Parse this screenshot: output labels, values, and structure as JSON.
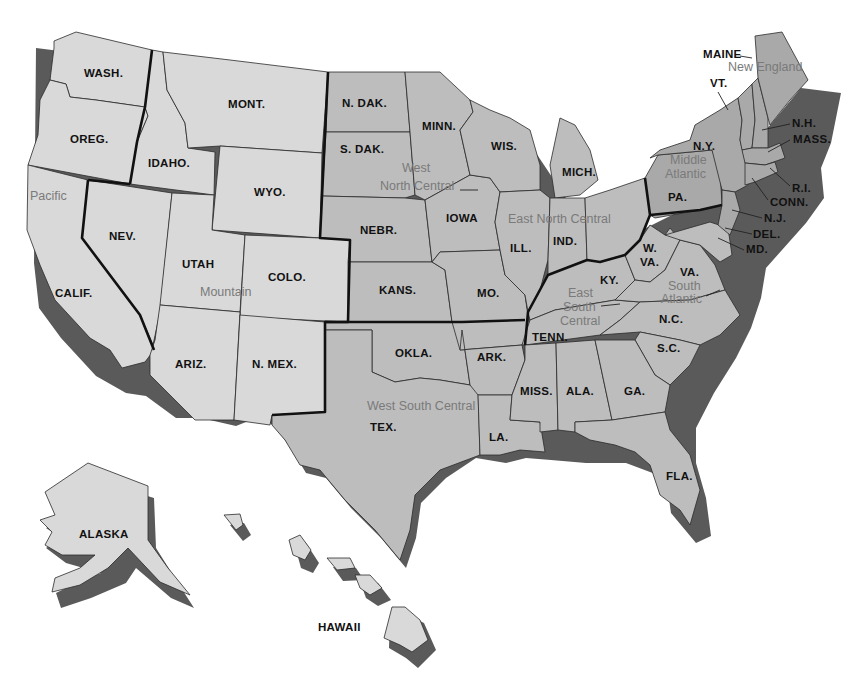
{
  "map": {
    "title": "United States Census Regions",
    "colors": {
      "mountain_pacific": "#d9d9d9",
      "central": "#bdbdbd",
      "northeast": "#a9a9a9",
      "shadow": "#5a5a5a",
      "region_label": "#7a7a7a",
      "state_label": "#111111"
    },
    "regions": [
      {
        "name": "Pacific",
        "x": 30,
        "y": 200
      },
      {
        "name": "Mountain",
        "x": 200,
        "y": 296
      },
      {
        "name": "West",
        "x": 402,
        "y": 172
      },
      {
        "name": "North Central",
        "x": 380,
        "y": 190
      },
      {
        "name": "East North Central",
        "x": 508,
        "y": 223
      },
      {
        "name": "New England",
        "x": 728,
        "y": 71
      },
      {
        "name": "Middle",
        "x": 670,
        "y": 164
      },
      {
        "name": "Atlantic",
        "x": 665,
        "y": 178
      },
      {
        "name": "East",
        "x": 568,
        "y": 297
      },
      {
        "name": "South",
        "x": 563,
        "y": 311
      },
      {
        "name": "Central",
        "x": 560,
        "y": 325
      },
      {
        "name": "South",
        "x": 668,
        "y": 290
      },
      {
        "name": "Atlantic",
        "x": 661,
        "y": 303
      },
      {
        "name": "West South Central",
        "x": 367,
        "y": 410
      }
    ],
    "states": [
      {
        "label": "WASH.",
        "x": 84,
        "y": 77
      },
      {
        "label": "OREG.",
        "x": 70,
        "y": 143
      },
      {
        "label": "IDAHO.",
        "x": 148,
        "y": 167
      },
      {
        "label": "MONT.",
        "x": 228,
        "y": 108
      },
      {
        "label": "WYO.",
        "x": 254,
        "y": 196
      },
      {
        "label": "NEV.",
        "x": 109,
        "y": 240
      },
      {
        "label": "UTAH",
        "x": 182,
        "y": 268
      },
      {
        "label": "COLO.",
        "x": 268,
        "y": 281
      },
      {
        "label": "CALIF.",
        "x": 55,
        "y": 297
      },
      {
        "label": "ARIZ.",
        "x": 175,
        "y": 368
      },
      {
        "label": "N. MEX.",
        "x": 252,
        "y": 368
      },
      {
        "label": "N. DAK.",
        "x": 342,
        "y": 107
      },
      {
        "label": "S. DAK.",
        "x": 340,
        "y": 153
      },
      {
        "label": "NEBR.",
        "x": 360,
        "y": 234
      },
      {
        "label": "KANS.",
        "x": 379,
        "y": 294
      },
      {
        "label": "OKLA.",
        "x": 395,
        "y": 357
      },
      {
        "label": "TEX.",
        "x": 370,
        "y": 431
      },
      {
        "label": "MINN.",
        "x": 422,
        "y": 130
      },
      {
        "label": "IOWA",
        "x": 446,
        "y": 222
      },
      {
        "label": "MO.",
        "x": 477,
        "y": 297
      },
      {
        "label": "ARK.",
        "x": 477,
        "y": 361
      },
      {
        "label": "LA.",
        "x": 489,
        "y": 441
      },
      {
        "label": "WIS.",
        "x": 491,
        "y": 150
      },
      {
        "label": "MICH.",
        "x": 562,
        "y": 176
      },
      {
        "label": "ILL.",
        "x": 510,
        "y": 252
      },
      {
        "label": "IND.",
        "x": 553,
        "y": 245
      },
      {
        "label": "KY.",
        "x": 600,
        "y": 284
      },
      {
        "label": "TENN.",
        "x": 532,
        "y": 341
      },
      {
        "label": "MISS.",
        "x": 520,
        "y": 395
      },
      {
        "label": "ALA.",
        "x": 566,
        "y": 395
      },
      {
        "label": "GA.",
        "x": 624,
        "y": 395
      },
      {
        "label": "FLA.",
        "x": 666,
        "y": 480
      },
      {
        "label": "W.",
        "x": 643,
        "y": 252
      },
      {
        "label": "VA.",
        "x": 640,
        "y": 266
      },
      {
        "label": "VA.",
        "x": 680,
        "y": 276
      },
      {
        "label": "N.C.",
        "x": 659,
        "y": 323
      },
      {
        "label": "S.C.",
        "x": 657,
        "y": 352
      },
      {
        "label": "PA.",
        "x": 668,
        "y": 201
      },
      {
        "label": "N.Y.",
        "x": 693,
        "y": 150
      },
      {
        "label": "VT.",
        "x": 710,
        "y": 87
      },
      {
        "label": "MAINE",
        "x": 703,
        "y": 58
      },
      {
        "label": "N.H.",
        "x": 792,
        "y": 127
      },
      {
        "label": "MASS.",
        "x": 793,
        "y": 143
      },
      {
        "label": "R.I.",
        "x": 792,
        "y": 192
      },
      {
        "label": "CONN.",
        "x": 770,
        "y": 206
      },
      {
        "label": "N.J.",
        "x": 764,
        "y": 222
      },
      {
        "label": "DEL.",
        "x": 753,
        "y": 238
      },
      {
        "label": "MD.",
        "x": 746,
        "y": 253
      },
      {
        "label": "ALASKA",
        "x": 79,
        "y": 538
      },
      {
        "label": "HAWAII",
        "x": 318,
        "y": 631
      }
    ]
  }
}
